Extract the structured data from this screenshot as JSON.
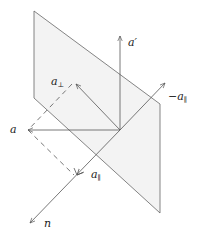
{
  "diagram": {
    "type": "vector-reflection-plane",
    "colors": {
      "stroke": "#555555",
      "plane_fill": "#f2f2f2",
      "text": "#222222"
    },
    "labels": {
      "a_prime": "a′",
      "a_perp": "a",
      "a_perp_sub": "⊥",
      "neg_a_par": "−a",
      "neg_a_par_sub": "∥",
      "a": "a",
      "a_par": "a",
      "a_par_sub": "∥",
      "n": "n"
    }
  }
}
